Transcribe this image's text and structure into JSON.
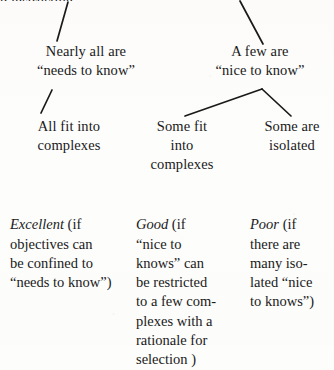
{
  "page": {
    "clipped_header_text": "p instruction.",
    "background_color": "#fdfdfc",
    "ink_color": "#1a1a1a"
  },
  "diagram": {
    "type": "tree-flow",
    "nodes": [
      {
        "id": "nearly-all",
        "text": "Nearly all are\n“needs to know”"
      },
      {
        "id": "a-few",
        "text": "A few are\n“nice to know”"
      },
      {
        "id": "all-fit",
        "text": "All fit into\ncomplexes"
      },
      {
        "id": "some-fit",
        "text": "Some fit\ninto\ncomplexes"
      },
      {
        "id": "some-isolated",
        "text": "Some are\nisolated"
      }
    ],
    "outcomes": [
      {
        "id": "excellent",
        "grade": "Excellent",
        "detail": " (if\nobjectives can\nbe confined to\n“needs to know”)"
      },
      {
        "id": "good",
        "grade": "Good",
        "detail": " (if\n“nice to\nknows” can\nbe restricted\nto a few com-\nplexes with a\nrationale for\nselection )"
      },
      {
        "id": "poor",
        "grade": "Poor",
        "detail": " (if\nthere are\nmany iso-\nlated “nice\nto knows”)"
      }
    ],
    "connectors": [
      {
        "id": "root-to-nearly-all",
        "from": [
          68,
          2
        ],
        "to": [
          57,
          41
        ]
      },
      {
        "id": "root-to-a-few",
        "from": [
          240,
          1
        ],
        "to": [
          263,
          44
        ]
      },
      {
        "id": "nearly-all-to-all-fit",
        "from": [
          52,
          90
        ],
        "to": [
          41,
          113
        ]
      },
      {
        "id": "a-few-to-some-fit",
        "from": [
          262,
          89
        ],
        "to": [
          185,
          116
        ]
      },
      {
        "id": "a-few-to-some-isolated",
        "from": [
          262,
          89
        ],
        "to": [
          291,
          116
        ]
      }
    ]
  }
}
